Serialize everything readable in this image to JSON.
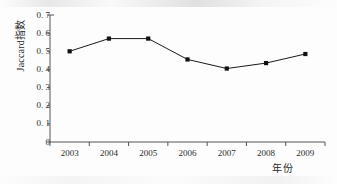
{
  "chart_data": {
    "type": "line",
    "title": "",
    "subtitle": "",
    "xlabel": "年份",
    "ylabel": "Jaccard指数",
    "ylabel_latin": "Jaccard",
    "ylabel_cjk": "指数",
    "categories": [
      "2003",
      "2004",
      "2005",
      "2006",
      "2007",
      "2008",
      "2009"
    ],
    "x": [
      2003,
      2004,
      2005,
      2006,
      2007,
      2008,
      2009
    ],
    "values": [
      0.5,
      0.57,
      0.57,
      0.455,
      0.405,
      0.435,
      0.485
    ],
    "series": [
      {
        "name": "Jaccard指数",
        "values": [
          0.5,
          0.57,
          0.57,
          0.455,
          0.405,
          0.435,
          0.485
        ],
        "marker": "square",
        "marker_color": "#111111",
        "line_color": "#1a1a1a"
      }
    ],
    "ylim": [
      0,
      0.7
    ],
    "xlim": [
      2002.5,
      2009.5
    ],
    "ytick_values": [
      0,
      0.1,
      0.2,
      0.3,
      0.4,
      0.5,
      0.6,
      0.7
    ],
    "ytick_labels": [
      "0",
      "0. 1",
      "0. 2",
      "0. 3",
      "0. 4",
      "0. 5",
      "0. 6",
      "0. 7"
    ],
    "xtick_labels": [
      "2003",
      "2004",
      "2005",
      "2006",
      "2007",
      "2008",
      "2009"
    ],
    "grid": false,
    "legend": false,
    "legend_position": "none",
    "spines": [
      "left",
      "bottom"
    ],
    "tick_direction": "out",
    "background_color": "#fdfdfd",
    "axis_color": "#555555",
    "annotations": []
  },
  "figure": {
    "ylabel_text": "Jaccard",
    "ylabel_cjk_text": "指数",
    "xlabel_text": "年份"
  }
}
